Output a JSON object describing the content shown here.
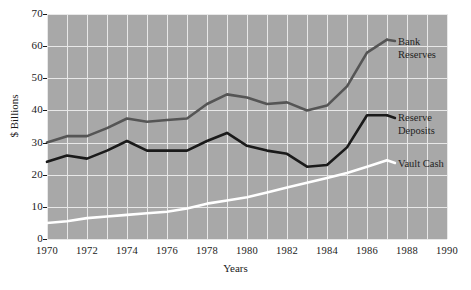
{
  "chart_data": {
    "type": "line",
    "title": "",
    "xlabel": "Years",
    "ylabel": "$ Billions",
    "xlim": [
      1970,
      1990
    ],
    "ylim": [
      0,
      70
    ],
    "xticks": [
      1970,
      1972,
      1974,
      1976,
      1978,
      1980,
      1982,
      1984,
      1986,
      1988,
      1990
    ],
    "yticks": [
      0,
      10,
      20,
      30,
      40,
      50,
      60,
      70
    ],
    "grid": true,
    "grid_color": "#e8e8e8",
    "plot_background": "#a8a8a8",
    "legend_position": "inline-right",
    "x": [
      1970,
      1971,
      1972,
      1973,
      1974,
      1975,
      1976,
      1977,
      1978,
      1979,
      1980,
      1981,
      1982,
      1983,
      1984,
      1985,
      1986,
      1987
    ],
    "series": [
      {
        "name": "Bank Reserves",
        "color": "#555555",
        "values": [
          30.0,
          32.0,
          32.0,
          34.5,
          37.5,
          36.5,
          37.0,
          37.5,
          42.0,
          45.0,
          44.0,
          42.0,
          42.5,
          40.0,
          41.5,
          47.5,
          58.0,
          62.0
        ]
      },
      {
        "name": "Reserve Deposits",
        "color": "#1a1a1a",
        "values": [
          24.0,
          26.0,
          25.0,
          27.5,
          30.5,
          27.5,
          27.5,
          27.5,
          30.5,
          33.0,
          29.0,
          27.5,
          26.5,
          22.5,
          23.0,
          28.5,
          38.5,
          38.5
        ]
      },
      {
        "name": "Vault Cash",
        "color": "#ffffff",
        "values": [
          5.0,
          5.5,
          6.5,
          7.0,
          7.5,
          8.0,
          8.5,
          9.5,
          11.0,
          12.0,
          13.0,
          14.5,
          16.0,
          17.5,
          19.0,
          20.5,
          22.5,
          24.5
        ]
      }
    ],
    "annotations": [
      {
        "name": "Bank Reserves",
        "line1": "Bank",
        "line2": "Reserves"
      },
      {
        "name": "Reserve Deposits",
        "line1": "Reserve",
        "line2": "Deposits"
      },
      {
        "name": "Vault Cash",
        "line1": "Vault Cash",
        "line2": ""
      }
    ]
  },
  "axis": {
    "y_label": "$ Billions",
    "x_label": "Years",
    "yticks": [
      "70",
      "60",
      "50",
      "40",
      "30",
      "20",
      "10",
      "0"
    ],
    "xticks": [
      "1970",
      "1972",
      "1974",
      "1976",
      "1978",
      "1980",
      "1982",
      "1984",
      "1986",
      "1988",
      "1990"
    ]
  },
  "legend": {
    "bank_reserves_l1": "Bank",
    "bank_reserves_l2": "Reserves",
    "reserve_deposits_l1": "Reserve",
    "reserve_deposits_l2": "Deposits",
    "vault_cash_l1": "Vault Cash"
  }
}
